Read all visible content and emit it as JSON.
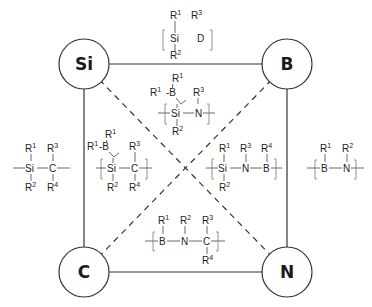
{
  "diagram": {
    "type": "quaternary-system-square",
    "nodes": [
      {
        "id": "si",
        "label": "Si",
        "corner": "top-left"
      },
      {
        "id": "b",
        "label": "B",
        "corner": "top-right"
      },
      {
        "id": "c",
        "label": "C",
        "corner": "bottom-left"
      },
      {
        "id": "n",
        "label": "N",
        "corner": "bottom-right"
      }
    ],
    "edges": [
      {
        "from": "Si",
        "to": "B",
        "style": "solid"
      },
      {
        "from": "Si",
        "to": "C",
        "style": "solid"
      },
      {
        "from": "B",
        "to": "N",
        "style": "solid"
      },
      {
        "from": "C",
        "to": "N",
        "style": "solid"
      },
      {
        "from": "Si",
        "to": "N",
        "style": "dashed"
      },
      {
        "from": "B",
        "to": "C",
        "style": "dashed"
      }
    ],
    "structures": {
      "si_b": {
        "name": "Si-B unit",
        "atoms": [
          "Si",
          "B"
        ],
        "substituents": [
          "R",
          "1",
          "R",
          "2",
          "R",
          "3"
        ]
      },
      "si_b_n": {
        "name": "boron-modified polysilazane",
        "atoms": [
          "Si",
          "N",
          "B"
        ],
        "substituents": [
          "R",
          "1",
          "R",
          "1",
          "R",
          "2",
          "R",
          "3"
        ],
        "prefix": "R"
      },
      "si_c": {
        "name": "polycarbosilane",
        "atoms": [
          "Si",
          "C"
        ],
        "substituents": [
          "R",
          "1",
          "R",
          "2",
          "R",
          "3",
          "R",
          "4"
        ]
      },
      "si_c_b": {
        "name": "boron-modified polycarbosilane",
        "atoms": [
          "Si",
          "C",
          "B"
        ],
        "substituents": [
          "R",
          "1",
          "R",
          "2",
          "R",
          "3",
          "R",
          "4"
        ]
      },
      "si_n_b": {
        "name": "polyborosilazane",
        "atoms": [
          "Si",
          "N",
          "B"
        ],
        "substituents": [
          "R",
          "1",
          "R",
          "2",
          "R",
          "3",
          "R",
          "4"
        ]
      },
      "b_n": {
        "name": "polyborazine",
        "atoms": [
          "B",
          "N"
        ],
        "substituents": [
          "R",
          "1",
          "R",
          "2"
        ]
      },
      "b_n_c": {
        "name": "boron carbonitride precursor",
        "atoms": [
          "B",
          "N",
          "C"
        ],
        "substituents": [
          "R",
          "1",
          "R",
          "2",
          "R",
          "3",
          "R",
          "4"
        ]
      }
    },
    "colors": {
      "line": "#333333",
      "text": "#222222",
      "background": "#ffffff"
    }
  }
}
